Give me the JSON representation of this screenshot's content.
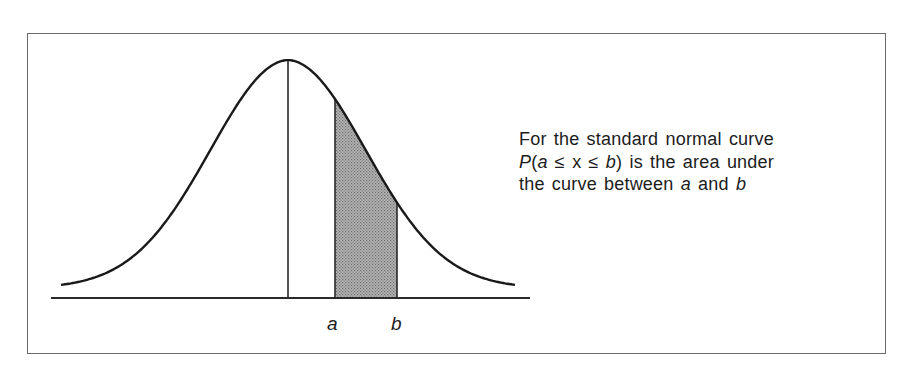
{
  "figure": {
    "caption_lines": [
      {
        "parts": [
          {
            "text": "For the standard normal curve",
            "italic": false
          }
        ]
      },
      {
        "parts": [
          {
            "text": "P",
            "italic": true
          },
          {
            "text": "(",
            "italic": false
          },
          {
            "text": "a",
            "italic": true
          },
          {
            "text": " ≤ ",
            "italic": false
          },
          {
            "text": "x",
            "italic": false
          },
          {
            "text": " ≤ ",
            "italic": false
          },
          {
            "text": "b",
            "italic": true
          },
          {
            "text": ")  is  the  area  under",
            "italic": false
          }
        ]
      },
      {
        "parts": [
          {
            "text": "the curve between ",
            "italic": false
          },
          {
            "text": "a",
            "italic": true
          },
          {
            "text": " and ",
            "italic": false
          },
          {
            "text": "b",
            "italic": true
          }
        ]
      }
    ],
    "labels": {
      "a": "a",
      "b": "b"
    },
    "colors": {
      "curve": "#1a1a1a",
      "frame": "#6a6a6a",
      "shade": "#a8a8a8",
      "shade_dot": "#6e6e6e"
    }
  },
  "chart_data": {
    "type": "area",
    "title": "Standard normal curve",
    "mean_line": true,
    "shaded_region": {
      "from": "a",
      "to": "b"
    },
    "x_tick_labels": [
      "a",
      "b"
    ],
    "xlabel": "",
    "ylabel": "",
    "grid": false,
    "geometry_px": {
      "axis_y": 298,
      "axis_x_start": 51,
      "axis_x_end": 530,
      "mean_x": 288,
      "peak_y": 66,
      "curve_x_start": 61,
      "curve_x_end": 516,
      "a_x": 335,
      "b_x": 397,
      "sigma_px": 78,
      "tail_offset_px": 9
    }
  }
}
